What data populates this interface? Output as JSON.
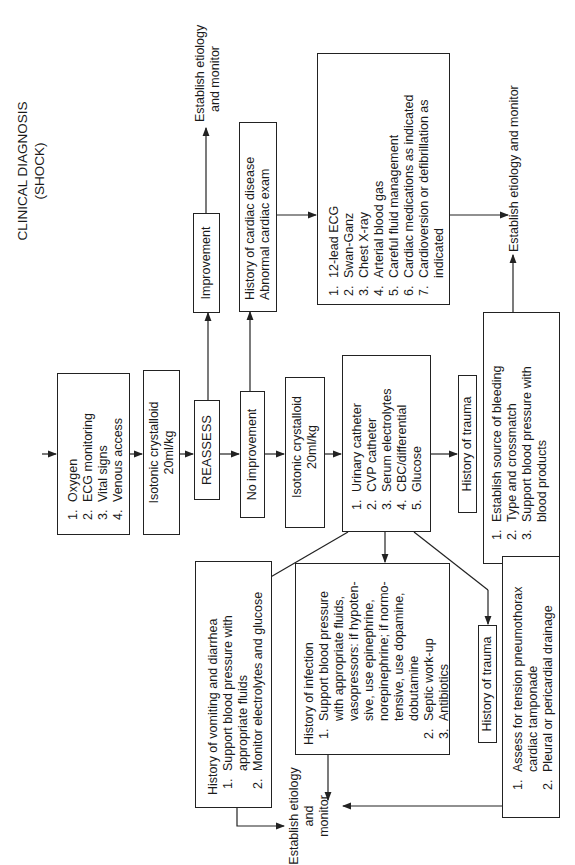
{
  "title": {
    "line1": "CLINICAL DIAGNOSIS",
    "line2": "(SHOCK)"
  },
  "initial_steps": {
    "items": [
      "Oxygen",
      "ECG monitoring",
      "Vital signs",
      "Venous access"
    ]
  },
  "fluid_1": {
    "line1": "Isotonic crystalloid",
    "line2": "20ml/kg"
  },
  "reassess": {
    "label": "REASSESS"
  },
  "improvement": {
    "label": "Improvement"
  },
  "no_improvement": {
    "label": "No improvement"
  },
  "establish_top": {
    "line1": "Establish etiology",
    "line2": "and monitor"
  },
  "cardiac_history": {
    "line1": "History of cardiac disease",
    "line2": "Abnormal cardiac exam"
  },
  "cardiac_workup": {
    "items": [
      "12-lead ECG",
      "Swan-Ganz",
      "Chest X-ray",
      "Arterial blood gas",
      "Careful fluid management",
      "Cardiac medications as indicated",
      "Cardioversion or defibrillation as",
      "indicated"
    ]
  },
  "establish_right": {
    "label": "Establish etiology and monitor"
  },
  "fluid_2": {
    "line1": "Isotonic crystalloid",
    "line2": "20ml/kg"
  },
  "monitoring": {
    "items": [
      "Urinary catheter",
      "CVP catheter",
      "Serum electrolytes",
      "CBC/differential",
      "Glucose"
    ]
  },
  "trauma_upper": {
    "label": "History of trauma"
  },
  "bleeding": {
    "items": [
      "Establish source of bleeding",
      "Type and crossmatch",
      "Support blood pressure with",
      "blood products"
    ]
  },
  "vomiting": {
    "heading": "History of vomiting and diarrhea",
    "items": [
      "Support blood pressure with",
      "appropriate fluids",
      "Monitor electrolytes and glucose"
    ]
  },
  "infection": {
    "heading": "History of infection",
    "items": [
      "Support blood pressure",
      "with appropriate fluids,",
      "vasopressors: if hypoten-",
      "sive, use epinephrine,",
      "norepinephrine; if normo-",
      "tensive, use dopamine,",
      "dobutamine",
      "Septic work-up",
      "Antibiotics"
    ]
  },
  "trauma_lower": {
    "label": "History of trauma"
  },
  "tension": {
    "items": [
      "Assess for tension pneumothorax",
      "cardiac tamponade",
      "Pleural or pericardial drainage"
    ]
  },
  "establish_bottom": {
    "line1": "Establish etiology",
    "line2": "and",
    "line3": "monitor"
  },
  "numbers": {
    "n1": "1.",
    "n2": "2.",
    "n3": "3.",
    "n4": "4.",
    "n5": "5.",
    "n6": "6.",
    "n7": "7."
  }
}
